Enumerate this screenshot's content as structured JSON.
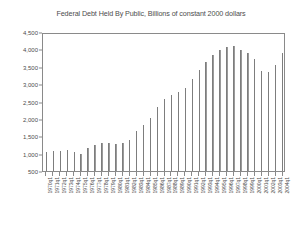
{
  "chart_data": {
    "type": "bar",
    "title": "Federal Debt Held By Public, Billions of constant 2000 dollars",
    "xlabel": "",
    "ylabel": "",
    "ylim": [
      500,
      4500
    ],
    "ytick_labels": [
      "4,500",
      "4,000",
      "3,500",
      "3,000",
      "2,500",
      "2,000",
      "1,500",
      "1,000",
      "500"
    ],
    "ytick_values": [
      4500,
      4000,
      3500,
      3000,
      2500,
      2000,
      1500,
      1000,
      500
    ],
    "grid": false,
    "legend": "none",
    "categories": [
      "1970q1",
      "1971q1",
      "1972q1",
      "1973q1",
      "1974q1",
      "1975q1",
      "1976q1",
      "1977q1",
      "1978q1",
      "1979q1",
      "1980q1",
      "1981q1",
      "1982q1",
      "1983q1",
      "1984q1",
      "1985q1",
      "1986q1",
      "1987q1",
      "1988q1",
      "1989q1",
      "1990q1",
      "1991q1",
      "1992q1",
      "1993q1",
      "1994q1",
      "1995q1",
      "1996q1",
      "1997q1",
      "1998q1",
      "1999q1",
      "2000q1",
      "2001q1",
      "2002q1",
      "2003q1",
      "2004q1"
    ],
    "values": [
      1040,
      1070,
      1075,
      1100,
      1060,
      1000,
      1160,
      1250,
      1310,
      1320,
      1270,
      1300,
      1390,
      1660,
      1830,
      2040,
      2330,
      2560,
      2680,
      2780,
      2890,
      3140,
      3420,
      3650,
      3850,
      3980,
      4080,
      4100,
      3990,
      3900,
      3720,
      3390,
      3350,
      3540,
      3910
    ]
  }
}
